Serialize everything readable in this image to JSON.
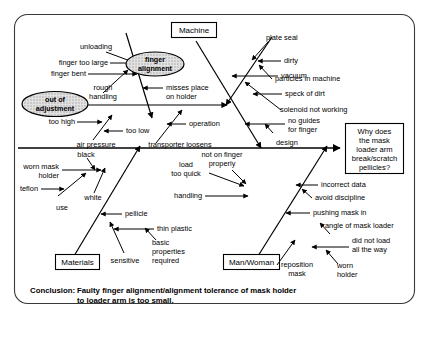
{
  "diagram": {
    "type": "fishbone-ishikawa",
    "effect": {
      "lines": [
        "Why does",
        "the mask",
        "loader arm",
        "break/scratch",
        "pellicles?"
      ]
    },
    "categories": [
      {
        "id": "machine",
        "label": "Machine"
      },
      {
        "id": "materials",
        "label": "Materials"
      },
      {
        "id": "man-woman",
        "label": "Man/Woman"
      }
    ],
    "highlights": [
      {
        "id": "finger-alignment",
        "lines": [
          "finger",
          "alignment"
        ]
      },
      {
        "id": "out-of-adjustment",
        "lines": [
          "out of",
          "adjustment"
        ]
      }
    ],
    "causes": {
      "machine_upper_left": [
        "unloading",
        "finger too large",
        "finger bent",
        "rough",
        "handling",
        "misses place",
        "on holder"
      ],
      "machine_upper_right": [
        "plate seal",
        "dirty",
        "particles in machine",
        "vacuum",
        "speck of dirt",
        "solenoid not working",
        "no guides",
        "for finger",
        "design"
      ],
      "adjustment_mid": [
        "too high",
        "too low",
        "air pressure",
        "operation",
        "transporter loosens"
      ],
      "materials_lower": [
        "black",
        "worn mask",
        "holder",
        "teflon",
        "white",
        "use",
        "pellicle",
        "thin plastic",
        "sensitive",
        "basic",
        "properties",
        "required"
      ],
      "man_woman_lower": [
        "load",
        "too quick",
        "handling",
        "not on finger",
        "properly",
        "incorrect data",
        "avoid discipline",
        "pushing mask in",
        "angle of mask loader",
        "did not load",
        "all the way",
        "reposition",
        "mask",
        "worn",
        "holder"
      ]
    }
  },
  "conclusion": {
    "label": "Conclusion:",
    "line1": "Faulty finger alignment/alignment tolerance of mask holder",
    "line2": "to loader arm is too small."
  },
  "colors": {
    "ink": "#000000",
    "frame": "#3a3a3a",
    "highlight_fill": "#d9d9d9",
    "background": "#ffffff"
  }
}
